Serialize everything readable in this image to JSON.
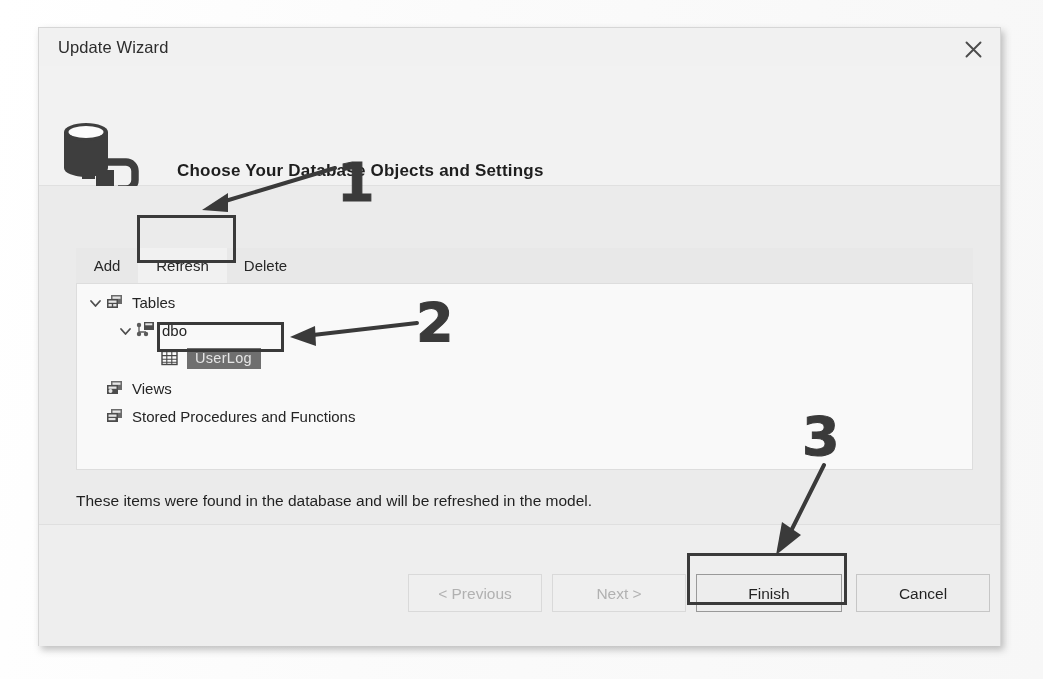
{
  "window": {
    "title": "Update Wizard",
    "close_icon": "close-icon"
  },
  "header": {
    "icon": "database-connection-icon",
    "title": "Choose Your Database Objects and Settings"
  },
  "tabs": [
    {
      "label": "Add",
      "selected": false
    },
    {
      "label": "Refresh",
      "selected": true
    },
    {
      "label": "Delete",
      "selected": false
    }
  ],
  "tree": {
    "nodes": [
      {
        "label": "Tables",
        "icon": "tables-icon",
        "expanded": true,
        "selected": false
      },
      {
        "label": "dbo",
        "icon": "schema-icon",
        "expanded": true,
        "selected": false
      },
      {
        "label": "UserLog",
        "icon": "table-icon",
        "expanded": null,
        "selected": true
      },
      {
        "label": "Views",
        "icon": "views-icon",
        "expanded": null,
        "selected": false
      },
      {
        "label": "Stored Procedures and Functions",
        "icon": "sproc-icon",
        "expanded": null,
        "selected": false
      }
    ]
  },
  "info": {
    "text": "These items were found in the database and will be refreshed in the model."
  },
  "buttons": [
    {
      "label": "< Previous",
      "enabled": false
    },
    {
      "label": "Next >",
      "enabled": false
    },
    {
      "label": "Finish",
      "enabled": true
    },
    {
      "label": "Cancel",
      "enabled": true
    }
  ],
  "annotations": [
    {
      "number": "1",
      "points_to": "refresh-tab"
    },
    {
      "number": "2",
      "points_to": "userlog-tree-node"
    },
    {
      "number": "3",
      "points_to": "finish-button"
    }
  ],
  "colors": {
    "dialog_bg": "#f2f2f2",
    "panel_bg": "#fdfdfd",
    "selection_bg": "#6f6f6f",
    "annotation_ink": "#3a3a3a",
    "text": "#1f1f1f",
    "disabled_text": "#b3b3b3"
  }
}
